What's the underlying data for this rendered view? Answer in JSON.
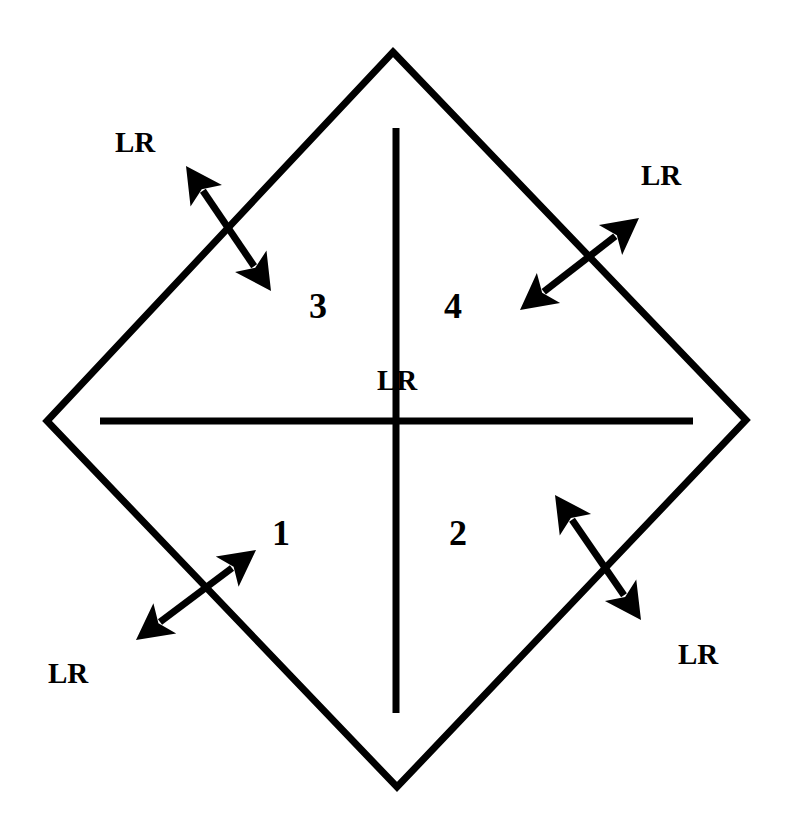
{
  "diagram": {
    "type": "quadrant-diamond",
    "colors": {
      "stroke": "#000000",
      "background": "#ffffff"
    },
    "outline": {
      "top": [
        393,
        52
      ],
      "right": [
        746,
        420
      ],
      "bottom": [
        397,
        787
      ],
      "left": [
        47,
        421
      ]
    },
    "dividers": {
      "vertical": {
        "x": 396,
        "y1": 128,
        "y2": 713
      },
      "horizontal": {
        "y": 421,
        "x1": 100,
        "x2": 693
      }
    },
    "quadrants": [
      {
        "id": "1",
        "label": "1",
        "x": 272,
        "y": 545
      },
      {
        "id": "2",
        "label": "2",
        "x": 449,
        "y": 545
      },
      {
        "id": "3",
        "label": "3",
        "x": 309,
        "y": 318
      },
      {
        "id": "4",
        "label": "4",
        "x": 444,
        "y": 318
      }
    ],
    "center_label": {
      "text": "LR",
      "x": 377,
      "y": 390
    },
    "edge_labels": [
      {
        "position": "top-left",
        "text": "LR",
        "x": 115,
        "y": 152
      },
      {
        "position": "top-right",
        "text": "LR",
        "x": 641,
        "y": 185
      },
      {
        "position": "bottom-left",
        "text": "LR",
        "x": 48,
        "y": 683
      },
      {
        "position": "bottom-right",
        "text": "LR",
        "x": 678,
        "y": 664
      }
    ],
    "arrows": [
      {
        "position": "top-left",
        "type": "double-headed",
        "from": [
          186,
          166
        ],
        "to": [
          271,
          291
        ]
      },
      {
        "position": "top-right",
        "type": "double-headed",
        "from": [
          520,
          310
        ],
        "to": [
          639,
          218
        ]
      },
      {
        "position": "bottom-left",
        "type": "double-headed",
        "from": [
          136,
          640
        ],
        "to": [
          256,
          550
        ]
      },
      {
        "position": "bottom-right",
        "type": "double-headed",
        "from": [
          555,
          495
        ],
        "to": [
          641,
          620
        ]
      }
    ]
  }
}
